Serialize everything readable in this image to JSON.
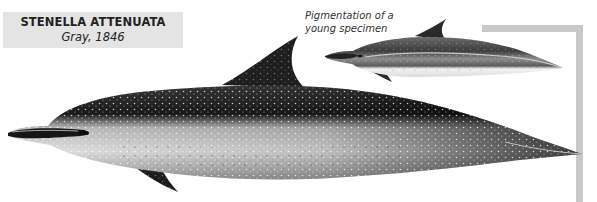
{
  "species_label": {
    "scientific_name": "STENELLA ATTENUATA",
    "authority": "Gray, 1846"
  },
  "caption": {
    "line1": "Pigmentation of a",
    "line2": "young specimen"
  },
  "illustrations": [
    {
      "name": "adult-pantropical-spotted-dolphin",
      "description": "Adult dolphin, spotted pigmentation, side view"
    },
    {
      "name": "young-pantropical-spotted-dolphin",
      "description": "Young specimen pigmentation, side view"
    }
  ],
  "colors": {
    "label_bg": "#e4e4e4",
    "bracket": "#c8c8c8",
    "body_dark": "#1e1e1e",
    "body_light": "#d8d8d8"
  }
}
